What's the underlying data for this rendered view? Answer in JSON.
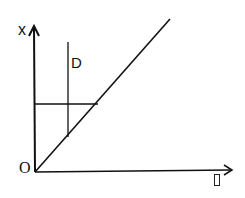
{
  "diagram": {
    "y_axis_label": "x",
    "x_axis_label_glyph": "▯",
    "origin_label": "O",
    "line_label": "D",
    "colors": {
      "ink": "#111111",
      "background": "#ffffff"
    },
    "elements": {
      "y_axis": {
        "from": [
          35,
          172
        ],
        "to": [
          34,
          26
        ]
      },
      "x_axis": {
        "from": [
          35,
          172
        ],
        "to": [
          232,
          170
        ]
      },
      "diagonal_line": {
        "from": [
          35,
          172
        ],
        "to": [
          170,
          19
        ]
      },
      "vertical_line_D": {
        "from": [
          68,
          42
        ],
        "to": [
          68,
          137
        ]
      },
      "horizontal_line": {
        "from": [
          35,
          104
        ],
        "to": [
          98,
          104
        ]
      }
    }
  }
}
